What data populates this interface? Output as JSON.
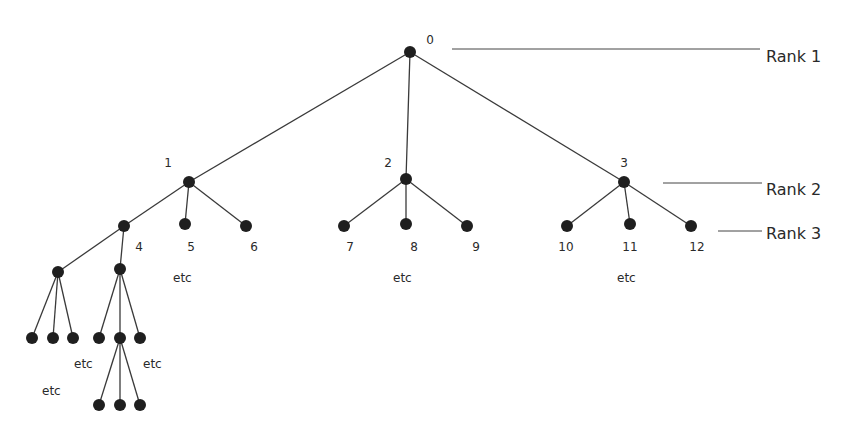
{
  "diagram": {
    "colors": {
      "node": "#1f1f1f",
      "edge": "#3a3a3a",
      "text": "#2a2a2a",
      "background": "#ffffff"
    },
    "nodes": [
      {
        "id": "n0",
        "label": "0",
        "x": 410,
        "y": 52,
        "lx": 430,
        "ly": 40
      },
      {
        "id": "n1",
        "label": "1",
        "x": 189,
        "y": 182,
        "lx": 168,
        "ly": 163
      },
      {
        "id": "n2",
        "label": "2",
        "x": 406,
        "y": 179,
        "lx": 388,
        "ly": 163
      },
      {
        "id": "n3",
        "label": "3",
        "x": 624,
        "y": 182,
        "lx": 624,
        "ly": 163
      },
      {
        "id": "n4",
        "label": "4",
        "x": 124,
        "y": 226,
        "lx": 139,
        "ly": 247
      },
      {
        "id": "n5",
        "label": "5",
        "x": 185,
        "y": 224,
        "lx": 191,
        "ly": 247
      },
      {
        "id": "n6",
        "label": "6",
        "x": 246,
        "y": 226,
        "lx": 254,
        "ly": 247
      },
      {
        "id": "n7",
        "label": "7",
        "x": 344,
        "y": 226,
        "lx": 350,
        "ly": 247
      },
      {
        "id": "n8",
        "label": "8",
        "x": 406,
        "y": 224,
        "lx": 414,
        "ly": 247
      },
      {
        "id": "n9",
        "label": "9",
        "x": 467,
        "y": 226,
        "lx": 476,
        "ly": 247
      },
      {
        "id": "n10",
        "label": "10",
        "x": 567,
        "y": 226,
        "lx": 566,
        "ly": 247
      },
      {
        "id": "n11",
        "label": "11",
        "x": 630,
        "y": 224,
        "lx": 630,
        "ly": 247
      },
      {
        "id": "n12",
        "label": "12",
        "x": 691,
        "y": 226,
        "lx": 697,
        "ly": 247
      },
      {
        "id": "a",
        "label": "",
        "x": 58,
        "y": 272
      },
      {
        "id": "b",
        "label": "",
        "x": 120,
        "y": 269
      },
      {
        "id": "a1",
        "label": "",
        "x": 32,
        "y": 338
      },
      {
        "id": "a2",
        "label": "",
        "x": 53,
        "y": 338
      },
      {
        "id": "a3",
        "label": "",
        "x": 73,
        "y": 338
      },
      {
        "id": "b1",
        "label": "",
        "x": 99,
        "y": 338
      },
      {
        "id": "b2",
        "label": "",
        "x": 120,
        "y": 338
      },
      {
        "id": "b3",
        "label": "",
        "x": 140,
        "y": 338
      },
      {
        "id": "c1",
        "label": "",
        "x": 99,
        "y": 405
      },
      {
        "id": "c2",
        "label": "",
        "x": 120,
        "y": 405
      },
      {
        "id": "c3",
        "label": "",
        "x": 140,
        "y": 405
      }
    ],
    "edges": [
      [
        "n0",
        "n1"
      ],
      [
        "n0",
        "n2"
      ],
      [
        "n0",
        "n3"
      ],
      [
        "n1",
        "n4"
      ],
      [
        "n1",
        "n5"
      ],
      [
        "n1",
        "n6"
      ],
      [
        "n2",
        "n7"
      ],
      [
        "n2",
        "n8"
      ],
      [
        "n2",
        "n9"
      ],
      [
        "n3",
        "n10"
      ],
      [
        "n3",
        "n11"
      ],
      [
        "n3",
        "n12"
      ],
      [
        "n4",
        "a"
      ],
      [
        "n4",
        "b"
      ],
      [
        "a",
        "a1"
      ],
      [
        "a",
        "a2"
      ],
      [
        "a",
        "a3"
      ],
      [
        "b",
        "b1"
      ],
      [
        "b",
        "b2"
      ],
      [
        "b",
        "b3"
      ],
      [
        "b2",
        "c1"
      ],
      [
        "b2",
        "c2"
      ],
      [
        "b2",
        "c3"
      ]
    ],
    "etc_labels": [
      {
        "text": "etc",
        "x": 173,
        "y": 278
      },
      {
        "text": "etc",
        "x": 393,
        "y": 278
      },
      {
        "text": "etc",
        "x": 617,
        "y": 278
      },
      {
        "text": "etc",
        "x": 74,
        "y": 364
      },
      {
        "text": "etc",
        "x": 143,
        "y": 364
      },
      {
        "text": "etc",
        "x": 42,
        "y": 391
      }
    ],
    "ranks": [
      {
        "label": "Rank 1",
        "x1": 452,
        "x2": 760,
        "y": 49,
        "tx": 766,
        "ty": 56
      },
      {
        "label": "Rank 2",
        "x1": 663,
        "x2": 762,
        "y": 183,
        "tx": 766,
        "ty": 189
      },
      {
        "label": "Rank 3",
        "x1": 718,
        "x2": 762,
        "y": 231,
        "tx": 766,
        "ty": 233
      }
    ]
  }
}
